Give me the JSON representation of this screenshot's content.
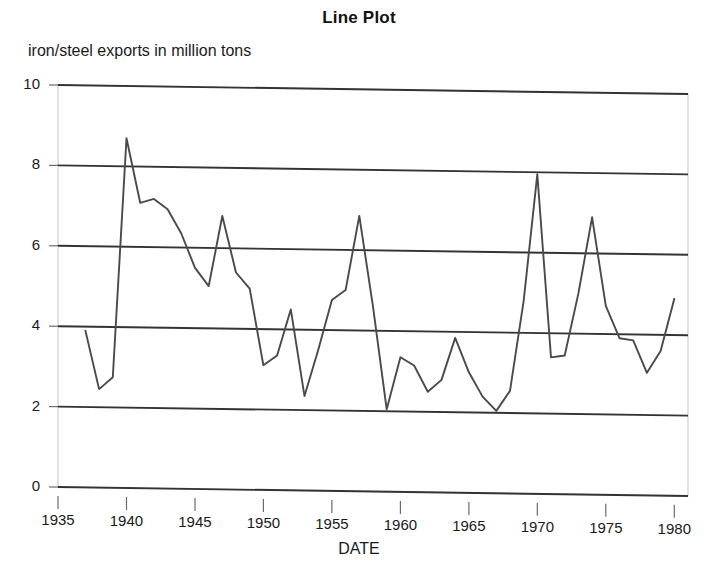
{
  "chart_data": {
    "type": "line",
    "title": "Line Plot",
    "subtitle": "iron/steel exports in million tons",
    "xlabel": "DATE",
    "ylabel": "",
    "xlim": [
      1935,
      1981
    ],
    "ylim": [
      0,
      10
    ],
    "grid": true,
    "legend": "none",
    "line_color": "#4a4a4a",
    "axis_color": "#333333",
    "background": "#ffffff",
    "xticks": [
      1935,
      1940,
      1945,
      1950,
      1955,
      1960,
      1965,
      1970,
      1975,
      1980
    ],
    "xtick_labels": [
      "1935",
      "1940",
      "1945",
      "1950",
      "1955",
      "1960",
      "1965",
      "1970",
      "1975",
      "1980"
    ],
    "yticks": [
      0,
      2,
      4,
      6,
      8,
      10
    ],
    "ytick_labels": [
      "0",
      "2",
      "4",
      "6",
      "8",
      "10"
    ],
    "x": [
      1937,
      1938,
      1939,
      1940,
      1941,
      1942,
      1943,
      1944,
      1945,
      1946,
      1947,
      1948,
      1949,
      1950,
      1951,
      1952,
      1953,
      1954,
      1955,
      1956,
      1957,
      1958,
      1959,
      1960,
      1961,
      1962,
      1963,
      1964,
      1965,
      1966,
      1967,
      1968,
      1969,
      1970,
      1971,
      1972,
      1973,
      1974,
      1975,
      1976,
      1977,
      1978,
      1979,
      1980
    ],
    "values": [
      3.9,
      2.45,
      2.75,
      8.7,
      7.1,
      7.2,
      6.95,
      6.35,
      5.5,
      5.05,
      6.8,
      5.4,
      5.0,
      3.1,
      3.35,
      4.5,
      2.35,
      3.5,
      4.75,
      5.0,
      6.85,
      4.6,
      2.05,
      3.35,
      3.15,
      2.5,
      2.8,
      3.85,
      3.0,
      2.4,
      2.05,
      2.55,
      4.8,
      7.95,
      3.4,
      3.45,
      5.0,
      6.9,
      4.7,
      3.9,
      3.85,
      3.05,
      3.6,
      4.9
    ],
    "series_name": "iron/steel exports"
  }
}
